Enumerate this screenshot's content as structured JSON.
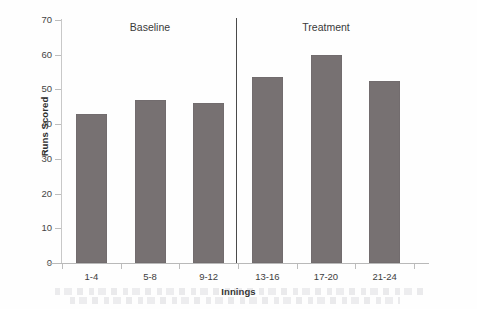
{
  "chart_data": {
    "type": "bar",
    "title": "",
    "subtitle": "",
    "xlabel": "Innings",
    "ylabel": "Runs Scored",
    "categories": [
      "1-4",
      "5-8",
      "9-12",
      "13-16",
      "17-20",
      "21-24"
    ],
    "values": [
      43,
      47,
      46,
      53.5,
      60,
      52.5
    ],
    "series": [
      {
        "name": "Runs Scored",
        "values": [
          43,
          47,
          46,
          53.5,
          60,
          52.5
        ],
        "color": "#777172"
      }
    ],
    "ylim": [
      0,
      70
    ],
    "ytick_step": 10,
    "yticks": [
      0,
      10,
      20,
      30,
      40,
      50,
      60,
      70
    ],
    "ytick_labels": [
      "0",
      "10",
      "20",
      "30",
      "40",
      "50",
      "60",
      "70"
    ],
    "grid": false,
    "legend": false,
    "legend_position": "none",
    "annotations": [
      {
        "text": "Baseline",
        "group_categories": [
          "1-4",
          "5-8",
          "9-12"
        ]
      },
      {
        "text": "Treatment",
        "group_categories": [
          "13-16",
          "17-20",
          "21-24"
        ]
      }
    ],
    "divider": {
      "label": "phase-divider",
      "between_categories": [
        "9-12",
        "13-16"
      ],
      "color": "#4a4a4a"
    },
    "axis_color": "#bdbdbd",
    "background_color": "#ffffff"
  },
  "groups": [
    {
      "label": "Baseline"
    },
    {
      "label": "Treatment"
    }
  ]
}
